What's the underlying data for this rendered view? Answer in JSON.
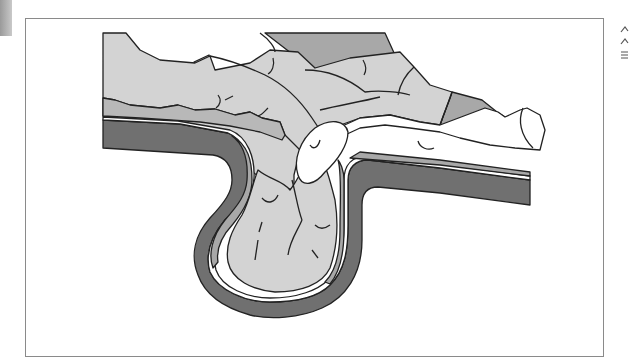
{
  "figure": {
    "colors": {
      "wall_dark": "#6e6e6e",
      "wall_mid": "#a9a9a9",
      "tissue_light": "#d2d2d2",
      "tissue_mid": "#b5b5b5",
      "lining_white": "#ffffff",
      "outline": "#222222",
      "frame_border": "#8a8a8a"
    }
  },
  "side_marks": [
    "^",
    "^",
    "="
  ]
}
